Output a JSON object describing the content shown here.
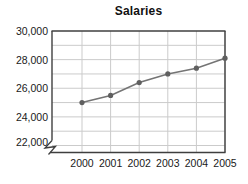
{
  "window": {
    "width": 248,
    "height": 184
  },
  "chart_data": {
    "type": "line",
    "title": "Salaries",
    "categories": [
      "2000",
      "2001",
      "2002",
      "2003",
      "2004",
      "2005"
    ],
    "series": [
      {
        "name": "Salaries",
        "values": [
          25000,
          25500,
          26400,
          27000,
          27400,
          28100
        ]
      }
    ],
    "xlabel": "",
    "ylabel": "",
    "ylim": [
      22000,
      30000
    ],
    "ytick_values": [
      22000,
      24000,
      26000,
      28000,
      30000
    ],
    "ytick_labels": [
      "22,000",
      "24,000",
      "26,000",
      "28,000",
      "30,000"
    ],
    "minor_grid_interval_y": 1000,
    "grid": true,
    "legend": "none",
    "axis_break": "y-axis broken below 22,000 (zigzag symbol at bottom-left)",
    "marker": "filled-circle",
    "colors": {
      "line": "#747474",
      "marker": "#5f5f5f",
      "grid": "#cbcbcb",
      "frame": "#3f3f3f",
      "text": "#1a1a1a",
      "title": "#111111",
      "background": "#ffffff"
    }
  }
}
